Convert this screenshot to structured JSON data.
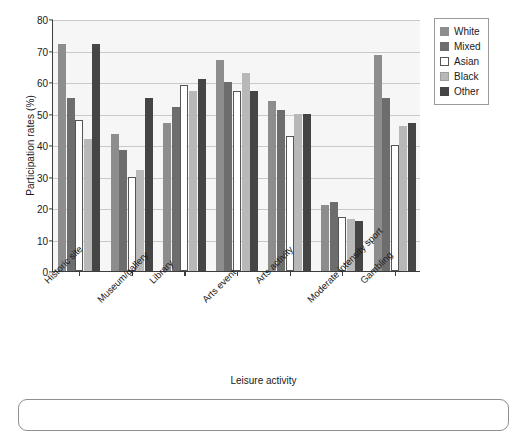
{
  "chart_data": {
    "type": "bar",
    "title": "",
    "xlabel": "Leisure activity",
    "ylabel": "Participation rates (%)",
    "ylim": [
      0,
      80
    ],
    "ytick_labels": [
      "0",
      "10",
      "20",
      "30",
      "40",
      "50",
      "60",
      "70",
      "80"
    ],
    "yticks": [
      0,
      10,
      20,
      30,
      40,
      50,
      60,
      70,
      80
    ],
    "grid": true,
    "legend_position": "top-right outside",
    "categories": [
      "Historic site",
      "Museum/gallery",
      "Library",
      "Arts event",
      "Arts activity",
      "Moderate intensity sport",
      "Gambling"
    ],
    "series": [
      {
        "name": "White",
        "color": "#8d8d8d",
        "values": [
          72,
          43.5,
          47,
          67,
          54,
          21,
          68.5
        ]
      },
      {
        "name": "Mixed",
        "color": "#6d6d6d",
        "values": [
          55,
          38.5,
          52,
          60,
          51,
          22,
          55
        ]
      },
      {
        "name": "Asian",
        "color": "#ffffff",
        "values": [
          48,
          30,
          59,
          57,
          43,
          17,
          40
        ]
      },
      {
        "name": "Black",
        "color": "#b8b8b8",
        "values": [
          42,
          32,
          57,
          63,
          50,
          16.5,
          46
        ]
      },
      {
        "name": "Other",
        "color": "#454545",
        "values": [
          72,
          55,
          61,
          57,
          50,
          16,
          47
        ]
      }
    ]
  },
  "legend": {
    "items": [
      {
        "label": "White"
      },
      {
        "label": "Mixed"
      },
      {
        "label": "Asian"
      },
      {
        "label": "Black"
      },
      {
        "label": "Other"
      }
    ]
  }
}
